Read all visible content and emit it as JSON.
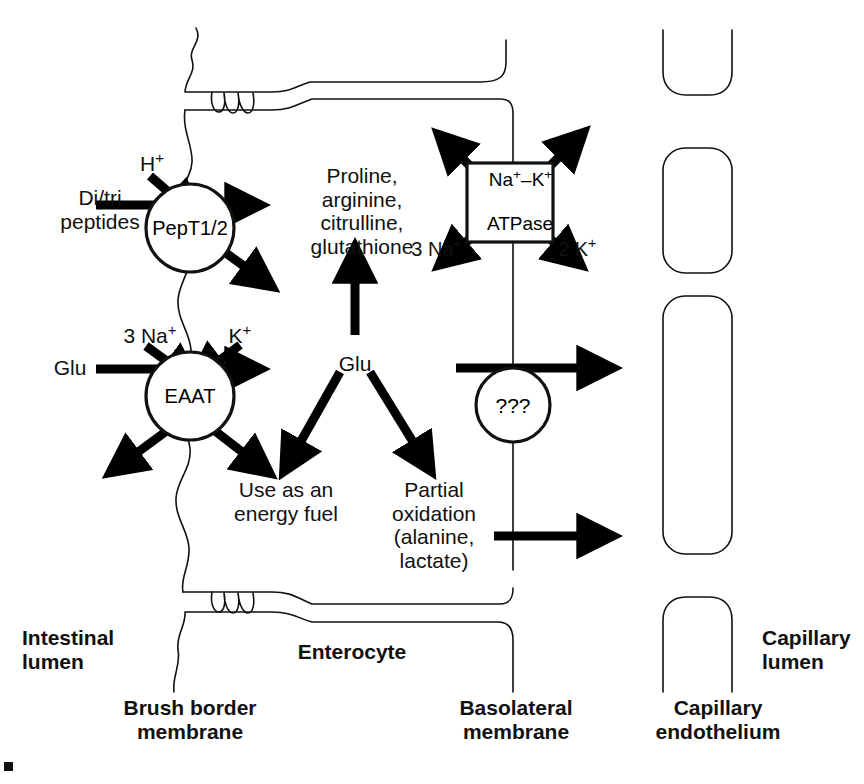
{
  "diagram": {
    "colors": {
      "stroke": "#111111",
      "fill_none": "none",
      "arrow": "#000000",
      "text": "#111111"
    },
    "transporters": [
      {
        "id": "pept",
        "label": "PepT1/2",
        "shape": "circle",
        "cx": 190,
        "cy": 228,
        "r": 44
      },
      {
        "id": "eaat",
        "label": "EAAT",
        "shape": "circle",
        "cx": 190,
        "cy": 396,
        "r": 44
      },
      {
        "id": "atpase",
        "label": "Na⁺–K⁺\nATPase",
        "line1": "Na",
        "line1b": "–K",
        "line2": "ATPase",
        "shape": "box",
        "x": 467,
        "y": 163,
        "w": 86,
        "h": 79
      },
      {
        "id": "unknown",
        "label": "???",
        "shape": "circle",
        "cx": 513,
        "cy": 405,
        "r": 37
      }
    ],
    "substrate_labels": [
      {
        "id": "ditri",
        "text": "Di/tri\npeptides",
        "x": 100,
        "y": 190,
        "align": "center",
        "weight": "regular"
      },
      {
        "id": "hplus",
        "text": "H⁺",
        "x": 150,
        "y": 158,
        "align": "center",
        "weight": "regular"
      },
      {
        "id": "glu-lumen",
        "text": "Glu",
        "x": 68,
        "y": 355,
        "align": "center",
        "weight": "regular"
      },
      {
        "id": "three-na-lumen",
        "text": "3 Na⁺",
        "x": 150,
        "y": 330,
        "align": "center",
        "weight": "regular"
      },
      {
        "id": "k-plus",
        "text": "K⁺",
        "x": 240,
        "y": 330,
        "align": "center",
        "weight": "regular"
      },
      {
        "id": "aa-products",
        "text": "Proline,\narginine,\ncitrulline,\nglutathione",
        "x": 355,
        "y": 168,
        "align": "center",
        "weight": "regular"
      },
      {
        "id": "glu-cell",
        "text": "Glu",
        "x": 355,
        "y": 352,
        "align": "center",
        "weight": "regular"
      },
      {
        "id": "energy-fuel",
        "text": "Use as an\nenergy fuel",
        "x": 282,
        "y": 480,
        "align": "center",
        "weight": "regular"
      },
      {
        "id": "partial-oxidation",
        "text": "Partial\noxidation\n(alanine,\nlactate)",
        "x": 432,
        "y": 480,
        "align": "center",
        "weight": "regular"
      },
      {
        "id": "three-na-atpase",
        "text": "3 Na⁺",
        "x": 455,
        "y": 245,
        "align": "right",
        "weight": "regular"
      },
      {
        "id": "two-k-atpase",
        "text": "2 K⁺",
        "x": 562,
        "y": 245,
        "align": "left",
        "weight": "regular"
      }
    ],
    "compartment_labels": [
      {
        "id": "intestinal-lumen",
        "text": "Intestinal\nlumen",
        "x": 22,
        "y": 630,
        "align": "left",
        "weight": "bold"
      },
      {
        "id": "enterocyte",
        "text": "Enterocyte",
        "x": 355,
        "y": 645,
        "align": "center",
        "weight": "bold"
      },
      {
        "id": "capillary-lumen",
        "text": "Capillary\nlumen",
        "x": 762,
        "y": 630,
        "align": "left",
        "weight": "bold"
      },
      {
        "id": "brush-border-membrane",
        "text": "Brush border\nmembrane",
        "x": 190,
        "y": 700,
        "align": "center",
        "weight": "bold"
      },
      {
        "id": "basolateral-membrane",
        "text": "Basolateral\nmembrane",
        "x": 513,
        "y": 700,
        "align": "center",
        "weight": "bold"
      },
      {
        "id": "capillary-endothelium",
        "text": "Capillary\nendothelium",
        "x": 718,
        "y": 700,
        "align": "center",
        "weight": "bold"
      }
    ],
    "membranes": {
      "brush_border_note": "wavy vertical line at left of enterocyte",
      "basolateral_note": "straight vertical line at right of enterocyte",
      "tight_junction_note": "zig-zag junctions top and bottom"
    },
    "capillary": {
      "cells": 4,
      "note": "stacked rounded rectangles forming capillary endothelium"
    }
  }
}
